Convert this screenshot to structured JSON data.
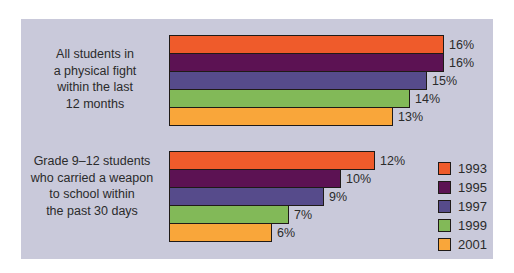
{
  "theme": {
    "panel_background": "#C9C9DA",
    "page_background": "#FFFFFF",
    "text_color": "#2B2B2B",
    "bar_border_color": "#1F1A17"
  },
  "chart_data": {
    "type": "bar",
    "orientation": "horizontal",
    "unit": "%",
    "xlim": [
      0,
      16
    ],
    "grid": false,
    "legend_position": "right",
    "categories": [
      "All students in\na physical fight\nwithin the last\n12 months",
      "Grade 9–12 students\nwho carried a weapon\nto school within\nthe past 30 days"
    ],
    "series": [
      {
        "name": "1993",
        "color": "#EF5B2B",
        "values": [
          16,
          12
        ]
      },
      {
        "name": "1995",
        "color": "#5C1253",
        "values": [
          16,
          10
        ]
      },
      {
        "name": "1997",
        "color": "#564B8B",
        "values": [
          15,
          9
        ]
      },
      {
        "name": "1999",
        "color": "#82B958",
        "values": [
          14,
          7
        ]
      },
      {
        "name": "2001",
        "color": "#F9A63A",
        "values": [
          13,
          6
        ]
      }
    ],
    "data_labels": [
      [
        "16%",
        "16%",
        "15%",
        "14%",
        "13%"
      ],
      [
        "12%",
        "10%",
        "9%",
        "7%",
        "6%"
      ]
    ]
  }
}
